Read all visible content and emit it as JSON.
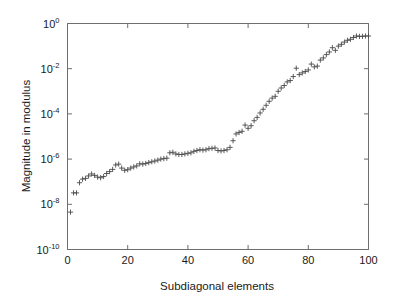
{
  "chart_data": {
    "type": "scatter",
    "title": "",
    "xlabel": "Subdiagonal elements",
    "ylabel": "Magnitude in modulus",
    "marker": "plus",
    "marker_color": "#4a4a4a",
    "grid": false,
    "legend": null,
    "yscale": "log",
    "xscale": "linear",
    "xlim": [
      0,
      100
    ],
    "ylim": [
      1e-10,
      1
    ],
    "xticks": [
      0,
      20,
      40,
      60,
      80,
      100
    ],
    "xticklabels": [
      "0",
      "20",
      "40",
      "60",
      "80",
      "100"
    ],
    "yticks": [
      1e-10,
      1e-08,
      1e-06,
      0.0001,
      0.01,
      1
    ],
    "yticklabels": [
      "10^-10",
      "10^-8",
      "10^-6",
      "10^-4",
      "10^-2",
      "10^0"
    ],
    "ytick_mantissa": [
      "10",
      "10",
      "10",
      "10",
      "10",
      "10"
    ],
    "ytick_exponent": [
      "-10",
      "-8",
      "-6",
      "-4",
      "-2",
      "0"
    ],
    "x": [
      1,
      2,
      3,
      4,
      5,
      6,
      7,
      8,
      9,
      10,
      11,
      12,
      13,
      14,
      15,
      16,
      17,
      18,
      19,
      20,
      21,
      22,
      23,
      24,
      25,
      26,
      27,
      28,
      29,
      30,
      31,
      32,
      33,
      34,
      35,
      36,
      37,
      38,
      39,
      40,
      41,
      42,
      43,
      44,
      45,
      46,
      47,
      48,
      49,
      50,
      51,
      52,
      53,
      54,
      55,
      56,
      57,
      58,
      59,
      60,
      61,
      62,
      63,
      64,
      65,
      66,
      67,
      68,
      69,
      70,
      71,
      72,
      73,
      74,
      75,
      76,
      77,
      78,
      79,
      80,
      81,
      82,
      83,
      84,
      85,
      86,
      87,
      88,
      89,
      90,
      91,
      92,
      93,
      94,
      95,
      96,
      97,
      98,
      99,
      100
    ],
    "y": [
      4.5e-09,
      3.2e-08,
      3.2e-08,
      9e-08,
      1.3e-07,
      1.4e-07,
      1.8e-07,
      2.2e-07,
      1.9e-07,
      1.6e-07,
      1.5e-07,
      1.7e-07,
      2.3e-07,
      2.8e-07,
      3.5e-07,
      5.5e-07,
      6e-07,
      4e-07,
      3.2e-07,
      3.4e-07,
      4e-07,
      4.5e-07,
      5e-07,
      6.2e-07,
      6e-07,
      6.4e-07,
      7e-07,
      7.6e-07,
      8.2e-07,
      9e-07,
      1e-06,
      1.05e-06,
      1.1e-06,
      1.9e-06,
      2e-06,
      1.7e-06,
      1.6e-06,
      1.6e-06,
      1.7e-06,
      1.8e-06,
      1.9e-06,
      2.2e-06,
      2.4e-06,
      2.6e-06,
      2.5e-06,
      2.6e-06,
      2.9e-06,
      3e-06,
      3.1e-06,
      2.4e-06,
      2.3e-06,
      2.4e-06,
      2.6e-06,
      3.3e-06,
      6.5e-06,
      1.3e-05,
      1.5e-05,
      1.7e-05,
      3.2e-05,
      2.3e-05,
      3e-05,
      5e-05,
      7e-05,
      0.00011,
      0.00016,
      0.00024,
      0.00036,
      0.0005,
      0.0006,
      0.001,
      0.0014,
      0.0018,
      0.0026,
      0.003,
      0.0045,
      0.0105,
      0.0055,
      0.0065,
      0.0075,
      0.0088,
      0.016,
      0.012,
      0.013,
      0.024,
      0.03,
      0.042,
      0.055,
      0.085,
      0.065,
      0.1,
      0.12,
      0.15,
      0.18,
      0.2,
      0.24,
      0.28,
      0.27,
      0.27,
      0.28,
      0.28
    ]
  }
}
